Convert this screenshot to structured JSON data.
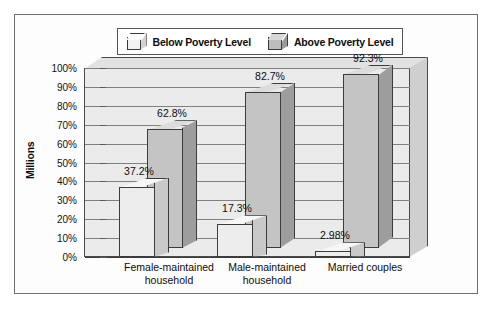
{
  "chart_data": {
    "type": "bar",
    "title": "",
    "subtitle": "",
    "xlabel": "",
    "ylabel": "Millions",
    "ylim": [
      0,
      100
    ],
    "grid": true,
    "legend_position": "top",
    "style": "3d-grouped-bar",
    "categories": [
      "Female-maintained\nhousehold",
      "Male-maintained\nhousehold",
      "Married couples"
    ],
    "series": [
      {
        "name": "Below Poverty Level",
        "values": [
          37.2,
          17.3,
          2.98
        ],
        "labels": [
          "37.2%",
          "17.3%",
          "2.98%"
        ],
        "color": "#ededed"
      },
      {
        "name": "Above Poverty Level",
        "values": [
          62.8,
          82.7,
          92.3
        ],
        "labels": [
          "62.8%",
          "82.7%",
          "92.3%"
        ],
        "color": "#c4c4c4"
      }
    ],
    "yticks": [
      "0%",
      "10%",
      "20%",
      "30%",
      "40%",
      "50%",
      "60%",
      "70%",
      "80%",
      "90%",
      "100%"
    ],
    "ytick_values": [
      0,
      10,
      20,
      30,
      40,
      50,
      60,
      70,
      80,
      90,
      100
    ]
  },
  "legend": {
    "items": [
      {
        "label": "Below Poverty Level",
        "swatch": "cube-light-icon"
      },
      {
        "label": "Above Poverty Level",
        "swatch": "cube-dark-icon"
      }
    ]
  },
  "colors": {
    "frame_border": "#6d6d6d",
    "plot_wall": "#ebebeb",
    "gridline": "#808080",
    "axis": "#3c3c3c",
    "series_below": "#ededed",
    "series_above": "#c4c4c4",
    "text": "#0d0d0d"
  }
}
